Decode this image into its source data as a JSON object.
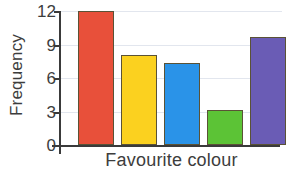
{
  "chart_data": {
    "type": "bar",
    "title": "",
    "xlabel": "Favourite colour",
    "ylabel": "Frequency",
    "categories": [
      "red",
      "yellow",
      "blue",
      "green",
      "purple"
    ],
    "values": [
      12,
      8.1,
      7.3,
      3.1,
      9.7
    ],
    "bar_colors": [
      "#e8503a",
      "#fbd11f",
      "#2a93e8",
      "#5cc336",
      "#6a5cb5"
    ],
    "bar_outline_color": "#5a5236",
    "ylim": [
      0,
      12
    ],
    "yticks": [
      0,
      3,
      6,
      9,
      12
    ],
    "ytick_labels": [
      "0",
      "3",
      "6",
      "9",
      "12"
    ],
    "xtick_labels": [
      "",
      "",
      "",
      "",
      ""
    ],
    "grid": true,
    "gridline_color": "#e2e6ee",
    "legend": false,
    "axis_color": "#3a3a3a",
    "text_color": "#3d3d3d",
    "background": "#ffffff"
  }
}
